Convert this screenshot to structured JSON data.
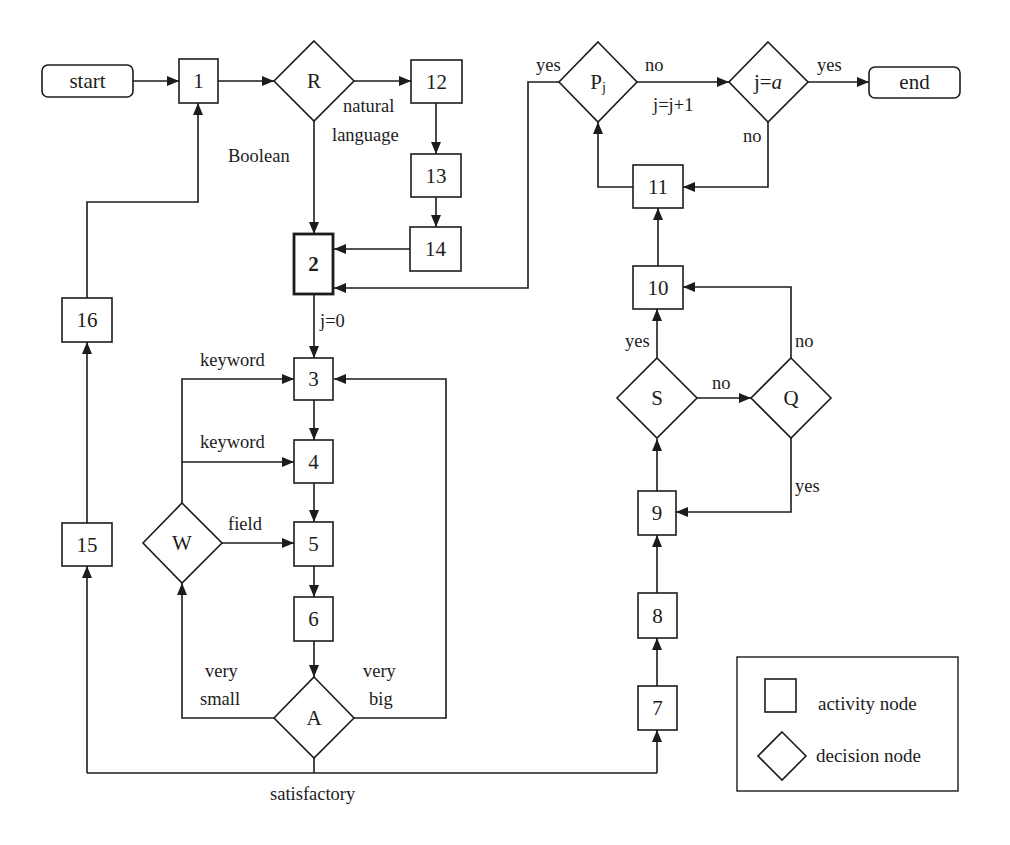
{
  "diagram": {
    "terminals": {
      "start": "start",
      "end": "end"
    },
    "activity_nodes": {
      "n1": "1",
      "n2": "2",
      "n3": "3",
      "n4": "4",
      "n5": "5",
      "n6": "6",
      "n7": "7",
      "n8": "8",
      "n9": "9",
      "n10": "10",
      "n11": "11",
      "n12": "12",
      "n13": "13",
      "n14": "14",
      "n15": "15",
      "n16": "16"
    },
    "decision_nodes": {
      "R": "R",
      "P": {
        "base": "P",
        "sub": "j"
      },
      "J": {
        "prefix": "j=",
        "var": "a"
      },
      "W": "W",
      "A": "A",
      "S": "S",
      "Q": "Q"
    },
    "edge_labels": {
      "r_boolean": "Boolean",
      "r_natural_1": "natural",
      "r_natural_2": "language",
      "init_j": "j=0",
      "w_keyword_1": "keyword",
      "w_keyword_2": "keyword",
      "w_field": "field",
      "a_small_1": "very",
      "a_small_2": "small",
      "a_big_1": "very",
      "a_big_2": "big",
      "a_satisfactory": "satisfactory",
      "p_yes": "yes",
      "p_no": "no",
      "p_increment": "j=j+1",
      "j_yes": "yes",
      "j_no": "no",
      "s_yes": "yes",
      "s_no": "no",
      "q_no": "no",
      "q_yes": "yes"
    },
    "edges": [
      {
        "from": "start",
        "to": "1"
      },
      {
        "from": "1",
        "to": "R"
      },
      {
        "from": "R",
        "to": "12",
        "label": "natural language"
      },
      {
        "from": "R",
        "to": "2",
        "label": "Boolean"
      },
      {
        "from": "12",
        "to": "13"
      },
      {
        "from": "13",
        "to": "14"
      },
      {
        "from": "14",
        "to": "2"
      },
      {
        "from": "2",
        "to": "3",
        "label": "j=0"
      },
      {
        "from": "3",
        "to": "4"
      },
      {
        "from": "4",
        "to": "5"
      },
      {
        "from": "5",
        "to": "6"
      },
      {
        "from": "6",
        "to": "A"
      },
      {
        "from": "A",
        "to": "W",
        "label": "very small"
      },
      {
        "from": "A",
        "to": "3",
        "label": "very big"
      },
      {
        "from": "A",
        "to": "15",
        "label": "satisfactory"
      },
      {
        "from": "A",
        "to": "7",
        "label": "satisfactory"
      },
      {
        "from": "W",
        "to": "3",
        "label": "keyword"
      },
      {
        "from": "W",
        "to": "4",
        "label": "keyword"
      },
      {
        "from": "W",
        "to": "5",
        "label": "field"
      },
      {
        "from": "15",
        "to": "16"
      },
      {
        "from": "16",
        "to": "1"
      },
      {
        "from": "7",
        "to": "8"
      },
      {
        "from": "8",
        "to": "9"
      },
      {
        "from": "9",
        "to": "S"
      },
      {
        "from": "S",
        "to": "10",
        "label": "yes"
      },
      {
        "from": "S",
        "to": "Q",
        "label": "no"
      },
      {
        "from": "Q",
        "to": "10",
        "label": "no"
      },
      {
        "from": "Q",
        "to": "9",
        "label": "yes"
      },
      {
        "from": "10",
        "to": "11"
      },
      {
        "from": "11",
        "to": "Pj"
      },
      {
        "from": "Pj",
        "to": "2",
        "label": "yes"
      },
      {
        "from": "Pj",
        "to": "j=a",
        "label": "no / j=j+1"
      },
      {
        "from": "j=a",
        "to": "end",
        "label": "yes"
      },
      {
        "from": "j=a",
        "to": "11",
        "label": "no"
      }
    ],
    "legend": {
      "activity": "activity node",
      "decision": "decision node"
    },
    "colors": {
      "stroke": "#1c1c1c",
      "background": "#ffffff"
    }
  }
}
